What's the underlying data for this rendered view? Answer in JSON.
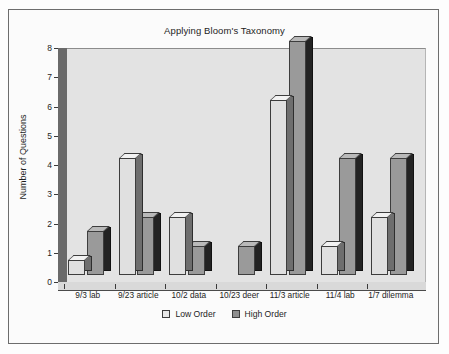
{
  "chart_data": {
    "type": "bar",
    "title": "Applying Bloom's Taxonomy",
    "xlabel": "",
    "ylabel": "Number of Questions",
    "ylim": [
      0,
      8
    ],
    "yticks": [
      0,
      1,
      2,
      3,
      4,
      5,
      6,
      7,
      8
    ],
    "grid": false,
    "legend_position": "bottom",
    "style": "3d-column",
    "categories": [
      "9/3 lab",
      "9/23 article",
      "10/2 data",
      "10/23 deer",
      "11/3 article",
      "11/4 lab",
      "1/7 dilemma"
    ],
    "series": [
      {
        "name": "Low Order",
        "color": "#e0e0e0",
        "values": [
          0.5,
          4,
          2,
          0,
          6,
          1,
          2
        ]
      },
      {
        "name": "High Order",
        "color": "#9a9a9a",
        "values": [
          1.5,
          2,
          1,
          1,
          8,
          4,
          4
        ]
      }
    ]
  },
  "legend": {
    "items": [
      {
        "label": "Low Order"
      },
      {
        "label": "High Order"
      }
    ]
  },
  "colors": {
    "low_order": "#e0e0e0",
    "high_order": "#9a9a9a",
    "plot_background": "#e3e3e3",
    "wall": "#6a6a6a",
    "text": "#1d1d1d"
  }
}
